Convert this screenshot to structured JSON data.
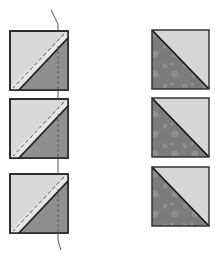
{
  "diagram": {
    "colors": {
      "light_fabric": "#d9d9d9",
      "dark_fabric": "#8f8f8f",
      "dark_print": "#7c7c7c",
      "print_spots": "#a8a8a8",
      "outline": "#222222",
      "stitch_line": "#555555",
      "thread": "#444444"
    },
    "left_column": {
      "label": "sewn-pairs",
      "units": [
        {
          "x": 10,
          "y": 31,
          "size": 58
        },
        {
          "x": 10,
          "y": 99,
          "size": 58
        },
        {
          "x": 10,
          "y": 174,
          "size": 58
        }
      ],
      "thread_x": 58
    },
    "right_column": {
      "label": "finished-hst-units",
      "units": [
        {
          "x": 152,
          "y": 30,
          "size": 57
        },
        {
          "x": 152,
          "y": 98,
          "size": 57
        },
        {
          "x": 152,
          "y": 167,
          "size": 57
        }
      ]
    }
  }
}
